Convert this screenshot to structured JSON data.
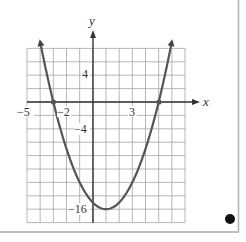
{
  "chart_data": {
    "type": "line",
    "title": "",
    "function": "y = x^2 - 2x - 15",
    "xlabel": "x",
    "ylabel": "y",
    "xlim": [
      -5,
      7
    ],
    "ylim": [
      -18,
      8
    ],
    "x_grid_step": 1,
    "y_grid_step": 2,
    "grid": true,
    "x_tick_labels": [
      {
        "value": -5,
        "text": "−5"
      },
      {
        "value": -2,
        "text": "−2"
      },
      {
        "value": 3,
        "text": "3"
      }
    ],
    "y_tick_labels": [
      {
        "value": 4,
        "text": "4"
      },
      {
        "value": -4,
        "text": "−4"
      },
      {
        "value": -16,
        "text": "−16"
      }
    ],
    "marked_points": [
      {
        "x": -3,
        "y": 0,
        "label": "x-intercept"
      },
      {
        "x": 5,
        "y": 0,
        "label": "x-intercept"
      }
    ],
    "vertex": {
      "x": 1,
      "y": -16
    },
    "series": [
      {
        "name": "parabola",
        "x": [
          -4.1,
          -4,
          -3,
          -2,
          -1,
          0,
          1,
          2,
          3,
          4,
          5,
          6,
          6.1
        ],
        "y": [
          9.01,
          9,
          0,
          -7,
          -12,
          -15,
          -16,
          -15,
          -12,
          -7,
          0,
          9,
          10.01
        ]
      }
    ],
    "colors": {
      "curve": "#555555",
      "grid": "#9a9a9a",
      "axis": "#333333",
      "frame": "#aaaaaa",
      "dot": "#111111"
    }
  },
  "labels": {
    "x_axis": "x",
    "y_axis": "y",
    "x_tick_neg5": "−5",
    "x_tick_neg2": "−2",
    "x_tick_3": "3",
    "y_tick_4": "4",
    "y_tick_neg4": "−4",
    "y_tick_neg16": "−16"
  }
}
